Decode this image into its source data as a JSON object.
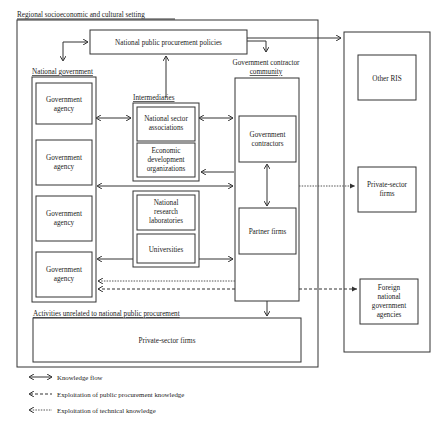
{
  "diagram": {
    "outer_setting_label": "Regional socioeconomic and cultural setting",
    "policies_box": "National public procurement policies",
    "national_government": {
      "header": "National government",
      "agencies": [
        "Government agency",
        "Government agency",
        "Government agency",
        "Government agency",
        "Government agency"
      ]
    },
    "intermediaries": {
      "header": "Intermediaries",
      "group1": [
        "National sector associations",
        "Economic development organizations"
      ],
      "group2": [
        "National research laboratories",
        "Universities"
      ]
    },
    "contractor_community": {
      "header_line1": "Government contractor",
      "header_line2": "community",
      "boxes": [
        "Government contractors",
        "Partner firms"
      ]
    },
    "unrelated_activities": {
      "header": "Activities unrelated to national public procurement",
      "box": "Private-sector firms"
    },
    "external": {
      "boxes": [
        "Other RIS",
        "Private-sector firms",
        "Foreign national government agencies"
      ]
    },
    "legend": [
      {
        "style": "solid-bidirectional",
        "label": "Knowledge flow"
      },
      {
        "style": "dashed",
        "label": "Exploitation of public procurement knowledge"
      },
      {
        "style": "dotted",
        "label": "Exploitation of technical knowledge"
      }
    ]
  }
}
